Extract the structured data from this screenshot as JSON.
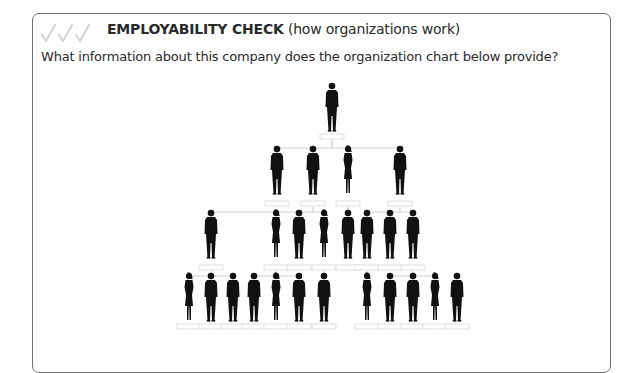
{
  "header": {
    "icon": "triple-checkmark-icon",
    "title_bold": "EMPLOYABILITY CHECK",
    "title_rest": " (how organizations work)"
  },
  "question": "What information about this company does the organization chart below provide?",
  "colors": {
    "border": "#6e6e6e",
    "checkmarks": "#d4d4d4",
    "connectors": "#cfcfcf",
    "silhouettes": "#111111",
    "text": "#2a2a2a"
  },
  "org_chart": {
    "levels": [
      {
        "level": 1,
        "count": 1,
        "description": "Top executive"
      },
      {
        "level": 2,
        "count": 4,
        "description": "Senior managers"
      },
      {
        "level": 3,
        "count": 8,
        "description": "Middle managers / staff"
      },
      {
        "level": 4,
        "count": 12,
        "description": "Employees"
      }
    ],
    "name_boxes": "blank"
  }
}
